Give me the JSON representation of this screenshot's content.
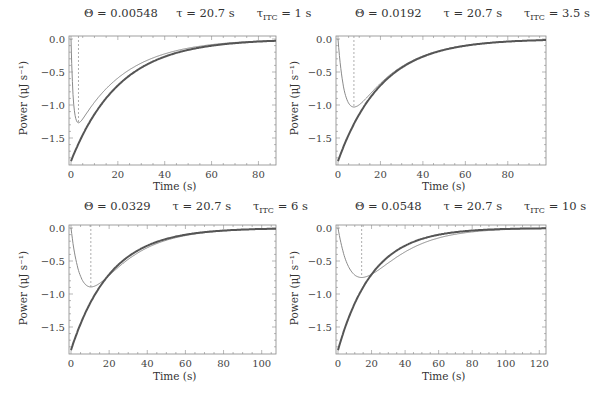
{
  "chart_data": [
    {
      "type": "line",
      "panel": "top-left",
      "title": {
        "theta": "Θ = 0.00548",
        "tau": "τ = 20.7 s",
        "tau_itc_symbol": "τ",
        "tau_itc_sub": "ITC",
        "tau_itc_value": " = 1 s"
      },
      "params": {
        "theta": 0.00548,
        "tau": 20.7,
        "tau_itc": 1,
        "amplitude": -1.85
      },
      "xlabel": "Time (s)",
      "ylabel": "Power (μJ s⁻¹)",
      "xlim": [
        0,
        87.5
      ],
      "ylim": [
        -1.9,
        0.05
      ],
      "xticks": [
        0,
        20,
        40,
        60,
        80
      ],
      "yticks": [
        0.0,
        -0.5,
        -1.0,
        -1.5
      ],
      "ytick_labels": [
        "0.0",
        "−0.5",
        "−1.0",
        "−1.5"
      ],
      "dashed_vline_x": 3.2,
      "series": [
        {
          "name": "heat signal (thick)",
          "x": [
            0,
            2,
            4,
            6,
            8,
            10,
            15,
            20,
            30,
            40,
            60,
            80
          ],
          "values": [
            -1.85,
            -1.68,
            -1.52,
            -1.38,
            -1.26,
            -1.14,
            -0.9,
            -0.7,
            -0.43,
            -0.27,
            -0.1,
            -0.04
          ]
        },
        {
          "name": "ITC response (thin)",
          "x": [
            0,
            1,
            2,
            3.2,
            6,
            10,
            20,
            40,
            60,
            80
          ],
          "values": [
            0,
            -1.15,
            -1.47,
            -1.55,
            -1.44,
            -1.19,
            -0.74,
            -0.28,
            -0.11,
            -0.04
          ]
        }
      ]
    },
    {
      "type": "line",
      "panel": "top-right",
      "title": {
        "theta": "Θ = 0.0192",
        "tau": "τ = 20.7 s",
        "tau_itc_symbol": "τ",
        "tau_itc_sub": "ITC",
        "tau_itc_value": " = 3.5 s"
      },
      "params": {
        "theta": 0.0192,
        "tau": 20.7,
        "tau_itc": 3.5,
        "amplitude": -1.85
      },
      "xlabel": "Time (s)",
      "ylabel": "Power (μJ s⁻¹)",
      "xlim": [
        0,
        98
      ],
      "ylim": [
        -1.9,
        0.05
      ],
      "xticks": [
        0,
        20,
        40,
        60,
        80
      ],
      "yticks": [
        0.0,
        -0.5,
        -1.0,
        -1.5
      ],
      "ytick_labels": [
        "0.0",
        "−0.5",
        "−1.0",
        "−1.5"
      ],
      "dashed_vline_x": 7.5,
      "series": [
        {
          "name": "heat signal (thick)",
          "x": [
            0,
            2,
            4,
            6,
            8,
            10,
            15,
            20,
            30,
            40,
            60,
            80,
            98
          ],
          "values": [
            -1.85,
            -1.68,
            -1.52,
            -1.38,
            -1.26,
            -1.14,
            -0.9,
            -0.7,
            -0.43,
            -0.27,
            -0.1,
            -0.04,
            -0.01
          ]
        },
        {
          "name": "ITC response (thin)",
          "x": [
            0,
            2,
            4,
            7.5,
            10,
            15,
            20,
            30,
            40,
            60,
            80,
            98
          ],
          "values": [
            0,
            -0.8,
            -1.09,
            -1.2,
            -1.16,
            -1.0,
            -0.82,
            -0.52,
            -0.32,
            -0.12,
            -0.05,
            -0.02
          ]
        }
      ]
    },
    {
      "type": "line",
      "panel": "bottom-left",
      "title": {
        "theta": "Θ = 0.0329",
        "tau": "τ = 20.7 s",
        "tau_itc_symbol": "τ",
        "tau_itc_sub": "ITC",
        "tau_itc_value": " = 6 s"
      },
      "params": {
        "theta": 0.0329,
        "tau": 20.7,
        "tau_itc": 6,
        "amplitude": -1.85
      },
      "xlabel": "Time (s)",
      "ylabel": "Power (μJ s⁻¹)",
      "xlim": [
        0,
        107.5
      ],
      "ylim": [
        -1.9,
        0.05
      ],
      "xticks": [
        0,
        20,
        40,
        60,
        80,
        100
      ],
      "yticks": [
        0.0,
        -0.5,
        -1.0,
        -1.5
      ],
      "ytick_labels": [
        "0.0",
        "−0.5",
        "−1.0",
        "−1.5"
      ],
      "dashed_vline_x": 10.4,
      "series": [
        {
          "name": "heat signal (thick)",
          "x": [
            0,
            2,
            4,
            6,
            8,
            10,
            15,
            20,
            30,
            40,
            60,
            80,
            100
          ],
          "values": [
            -1.85,
            -1.68,
            -1.52,
            -1.38,
            -1.26,
            -1.14,
            -0.9,
            -0.7,
            -0.43,
            -0.27,
            -0.1,
            -0.04,
            -0.015
          ]
        },
        {
          "name": "ITC response (thin)",
          "x": [
            0,
            3,
            6,
            10.4,
            15,
            20,
            30,
            40,
            60,
            80,
            100
          ],
          "values": [
            0,
            -0.63,
            -0.88,
            -1.01,
            -0.97,
            -0.86,
            -0.6,
            -0.39,
            -0.15,
            -0.06,
            -0.02
          ]
        }
      ]
    },
    {
      "type": "line",
      "panel": "bottom-right",
      "title": {
        "theta": "Θ = 0.0548",
        "tau": "τ = 20.7 s",
        "tau_itc_symbol": "τ",
        "tau_itc_sub": "ITC",
        "tau_itc_value": " = 10 s"
      },
      "params": {
        "theta": 0.0548,
        "tau": 20.7,
        "tau_itc": 10,
        "amplitude": -1.85
      },
      "xlabel": "Time (s)",
      "ylabel": "Power (μJ s⁻¹)",
      "xlim": [
        0,
        124
      ],
      "ylim": [
        -1.9,
        0.05
      ],
      "xticks": [
        0,
        20,
        40,
        60,
        80,
        100,
        120
      ],
      "yticks": [
        0.0,
        -0.5,
        -1.0,
        -1.5
      ],
      "ytick_labels": [
        "0.0",
        "−0.5",
        "−1.0",
        "−1.5"
      ],
      "dashed_vline_x": 14.1,
      "series": [
        {
          "name": "heat signal (thick)",
          "x": [
            0,
            2,
            4,
            6,
            8,
            10,
            15,
            20,
            30,
            40,
            60,
            80,
            100,
            120
          ],
          "values": [
            -1.85,
            -1.68,
            -1.52,
            -1.38,
            -1.26,
            -1.14,
            -0.9,
            -0.7,
            -0.43,
            -0.27,
            -0.1,
            -0.04,
            -0.015,
            -0.006
          ]
        },
        {
          "name": "ITC response (thin)",
          "x": [
            0,
            5,
            10,
            14.1,
            20,
            30,
            40,
            60,
            80,
            100,
            120
          ],
          "values": [
            0,
            -0.56,
            -0.77,
            -0.84,
            -0.81,
            -0.65,
            -0.47,
            -0.2,
            -0.08,
            -0.03,
            -0.01
          ]
        }
      ]
    }
  ],
  "style": {
    "thick_color": "#555555",
    "thin_color": "#8a8a8a",
    "frame_color": "#888888",
    "dashed_color": "#999999"
  }
}
